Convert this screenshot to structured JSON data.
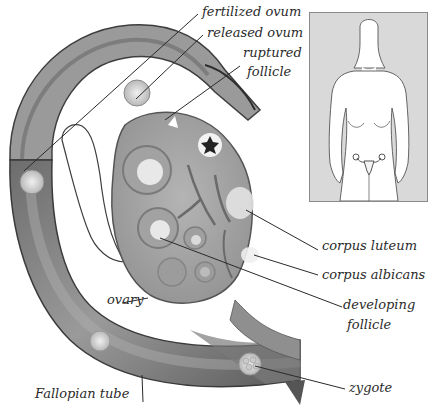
{
  "diagram": {
    "labels": {
      "fertilized_ovum": "fertilized ovum",
      "released_ovum": "released ovum",
      "ruptured_follicle_line1": "ruptured",
      "ruptured_follicle_line2": "follicle",
      "corpus_luteum": "corpus luteum",
      "corpus_albicans": "corpus albicans",
      "developing_follicle_line1": "developing",
      "developing_follicle_line2": "follicle",
      "ovary": "ovary",
      "fallopian_tube": "Fallopian tube",
      "zygote": "zygote"
    },
    "inset": {
      "description": "Female body outline with uterus and ovaries location"
    },
    "colors": {
      "tube_dark": "#4a4a4a",
      "tube_mid": "#8c8c8c",
      "tube_light": "#c4c4c4",
      "ovary_fill": "#a8a8a8",
      "follicle_light": "#e6e6e6",
      "inset_bg": "#d9d9d9",
      "leader_line": "#2a2a2a"
    }
  }
}
